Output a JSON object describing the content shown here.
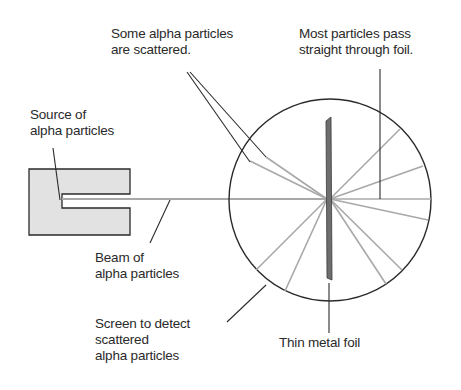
{
  "diagram": {
    "labels": {
      "scattered": {
        "line1": "Some alpha particles",
        "line2": "are scattered."
      },
      "straight": {
        "line1": "Most particles pass",
        "line2": "straight through foil."
      },
      "source": {
        "line1": "Source of",
        "line2": "alpha particles"
      },
      "beam": {
        "line1": "Beam of",
        "line2": "alpha particles"
      },
      "screen": {
        "line1": "Screen to detect",
        "line2": "scattered",
        "line3": "alpha particles"
      },
      "foil": {
        "line1": "Thin metal foil"
      }
    },
    "colors": {
      "outline": "#2a2a2a",
      "ray": "#a8a8a8",
      "source_fill": "#e2e2e2",
      "foil_fill": "#6e6e6e"
    }
  }
}
